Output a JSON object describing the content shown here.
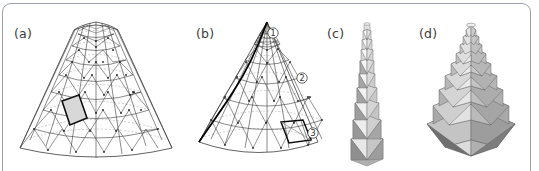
{
  "figure": {
    "type": "multi-panel-geometry-figure",
    "background_color": "#ffffff",
    "border_color": "#9aa0a6",
    "panel_count": 4
  },
  "panels": [
    {
      "id": "a",
      "label": "(a)",
      "label_x": 14,
      "label_y": 26,
      "caption_text": "(a)",
      "description": "triangulated conical mesh with dashed latitude rings and one highlighted rhombic cell",
      "mesh": {
        "rings": 9,
        "sectors": 12,
        "ring_style": "dashed",
        "edge_style": "solid",
        "highlight_fill": "#d8d8d8",
        "highlight_stroke": "#111111",
        "vertex_color": "#222222"
      }
    },
    {
      "id": "b",
      "label": "(b)",
      "label_x": 196,
      "label_y": 26,
      "caption_text": "(b)",
      "description": "same conical mesh with a bold geodesic spiral curve and three circled callout markers",
      "mesh": {
        "rings": 9,
        "sectors": 12,
        "ring_style": "dashed",
        "edge_style": "solid",
        "spiral_stroke": "#000000",
        "highlight_stroke": "#111111"
      },
      "markers": [
        {
          "label": "1",
          "x": 273,
          "y": 33
        },
        {
          "label": "2",
          "x": 302,
          "y": 78
        },
        {
          "label": "3",
          "x": 313,
          "y": 133
        }
      ]
    },
    {
      "id": "c",
      "label": "(c)",
      "label_x": 327,
      "label_y": 26,
      "caption_text": "(c)",
      "description": "rendered tall slender triangulated antiprism tower with grayscale shaded facets",
      "render": {
        "levels": 9,
        "sides": 8,
        "shading": "grayscale",
        "light_face": "#f2f2f2",
        "mid_face": "#c2c2c2",
        "dark_face": "#8d8d8d",
        "edge_color": "#6e6e6e"
      }
    },
    {
      "id": "d",
      "label": "(d)",
      "label_x": 419,
      "label_y": 26,
      "caption_text": "(d)",
      "description": "rendered stacked stepped antiprism tower with wide square base and shaded facets",
      "render": {
        "levels": 9,
        "sides": 8,
        "shading": "grayscale",
        "light_face": "#ededed",
        "mid_face": "#b9b9b9",
        "dark_face": "#7d7d7d",
        "edge_color": "#5e5e5e"
      }
    }
  ],
  "colors": {
    "stroke": "#3a3a3a",
    "dashed_ring": "#9b9b9b",
    "bold": "#000000",
    "label_text": "#3b3b3b",
    "frame": "#9aa0a6"
  }
}
